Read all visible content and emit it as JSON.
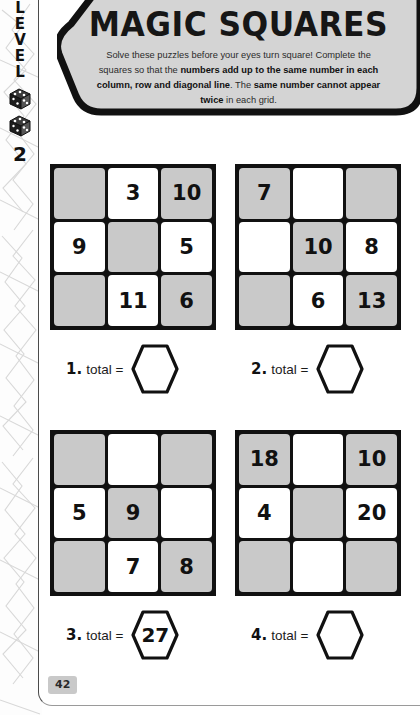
{
  "sidebar": {
    "level_word": "LEVEL",
    "level_letters": [
      "L",
      "E",
      "V",
      "E",
      "L"
    ],
    "level_number": "2",
    "dice_icon": "dice-icon"
  },
  "header": {
    "title": "MAGIC SQUARES",
    "instructions_plain": "Solve these puzzles before your eyes turn square! Complete the squares so that the numbers add up to the same number in each column, row and diagonal line. The same number cannot appear twice in each grid.",
    "line1_normal": "Solve these puzzles before your eyes turn square! Complete",
    "line2_normal": "the squares so that the ",
    "line2_bold": "numbers add up to the same",
    "line3_bold": "number in each column, row and diagonal line",
    "line3_normal": ". The",
    "line4_bold": "same number cannot appear twice",
    "line4_normal": " in each grid.",
    "banner_bg": "#d4d4d4",
    "banner_border": "#111111"
  },
  "puzzles": [
    {
      "index_label": "1.",
      "total_label": "total =",
      "answer": "",
      "cells": [
        {
          "value": "",
          "shaded": true
        },
        {
          "value": "3",
          "shaded": false
        },
        {
          "value": "10",
          "shaded": true
        },
        {
          "value": "9",
          "shaded": false
        },
        {
          "value": "",
          "shaded": true
        },
        {
          "value": "5",
          "shaded": false
        },
        {
          "value": "",
          "shaded": true
        },
        {
          "value": "11",
          "shaded": false
        },
        {
          "value": "6",
          "shaded": true
        }
      ]
    },
    {
      "index_label": "2.",
      "total_label": "total =",
      "answer": "",
      "cells": [
        {
          "value": "7",
          "shaded": true
        },
        {
          "value": "",
          "shaded": false
        },
        {
          "value": "",
          "shaded": true
        },
        {
          "value": "",
          "shaded": false
        },
        {
          "value": "10",
          "shaded": true
        },
        {
          "value": "8",
          "shaded": false
        },
        {
          "value": "",
          "shaded": true
        },
        {
          "value": "6",
          "shaded": false
        },
        {
          "value": "13",
          "shaded": true
        }
      ]
    },
    {
      "index_label": "3.",
      "total_label": "total =",
      "answer": "27",
      "cells": [
        {
          "value": "",
          "shaded": true
        },
        {
          "value": "",
          "shaded": false
        },
        {
          "value": "",
          "shaded": true
        },
        {
          "value": "5",
          "shaded": false
        },
        {
          "value": "9",
          "shaded": true
        },
        {
          "value": "",
          "shaded": false
        },
        {
          "value": "",
          "shaded": true
        },
        {
          "value": "7",
          "shaded": false
        },
        {
          "value": "8",
          "shaded": true
        }
      ]
    },
    {
      "index_label": "4.",
      "total_label": "total =",
      "answer": "",
      "cells": [
        {
          "value": "18",
          "shaded": true
        },
        {
          "value": "",
          "shaded": false
        },
        {
          "value": "10",
          "shaded": true
        },
        {
          "value": "4",
          "shaded": false
        },
        {
          "value": "",
          "shaded": true
        },
        {
          "value": "20",
          "shaded": false
        },
        {
          "value": "",
          "shaded": true
        },
        {
          "value": "",
          "shaded": false
        },
        {
          "value": "",
          "shaded": true
        }
      ]
    }
  ],
  "footer": {
    "page_number": "42"
  },
  "colors": {
    "shaded_cell": "#c9c9c9",
    "grid_line": "#111111",
    "banner_fill": "#d4d4d4",
    "text": "#111111"
  }
}
